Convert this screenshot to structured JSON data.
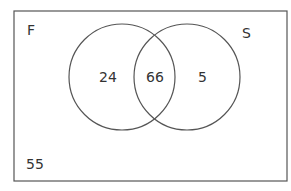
{
  "diagram": {
    "type": "venn",
    "universe_label_value": "55",
    "sets": [
      {
        "label": "F",
        "only_value": "24"
      },
      {
        "label": "S",
        "only_value": "5"
      }
    ],
    "intersection_value": "66",
    "colors": {
      "stroke": "#555555",
      "text": "#333333",
      "background": "#ffffff"
    }
  }
}
